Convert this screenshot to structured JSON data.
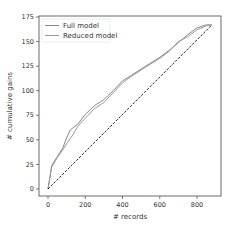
{
  "chart_data": {
    "type": "line",
    "title": "",
    "xlabel": "# records",
    "ylabel": "# cumulative gains",
    "xlim": [
      -40,
      930
    ],
    "ylim": [
      -8,
      175
    ],
    "xticks": [
      0,
      200,
      400,
      600,
      800
    ],
    "yticks": [
      0,
      25,
      50,
      75,
      100,
      125,
      150,
      175
    ],
    "grid": false,
    "legend_position": "upper left",
    "series": [
      {
        "name": "Full model",
        "color": "#888888",
        "style": "solid",
        "x": [
          0,
          20,
          50,
          80,
          100,
          120,
          160,
          200,
          250,
          300,
          350,
          400,
          450,
          500,
          550,
          600,
          650,
          700,
          750,
          800,
          850,
          880
        ],
        "y": [
          0,
          24,
          33,
          42,
          52,
          60,
          66,
          76,
          85,
          91,
          100,
          110,
          116,
          122,
          128,
          134,
          141,
          149,
          157,
          164,
          167,
          167
        ]
      },
      {
        "name": "Reduced model",
        "color": "#999999",
        "style": "solid",
        "x": [
          0,
          20,
          50,
          80,
          100,
          130,
          160,
          200,
          250,
          300,
          350,
          400,
          450,
          500,
          550,
          600,
          650,
          700,
          750,
          800,
          850,
          880
        ],
        "y": [
          0,
          22,
          32,
          40,
          46,
          54,
          64,
          72,
          82,
          88,
          98,
          108,
          115,
          121,
          127,
          133,
          140,
          150,
          155,
          162,
          166,
          167
        ]
      },
      {
        "name": "Baseline",
        "color": "#222222",
        "style": "dashed",
        "x": [
          0,
          880
        ],
        "y": [
          0,
          167
        ]
      }
    ]
  }
}
